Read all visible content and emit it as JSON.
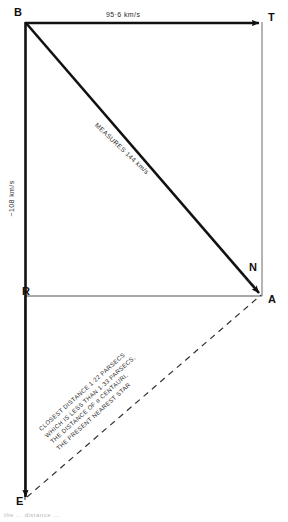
{
  "diagram": {
    "type": "vector-velocity-triangle",
    "background_color": "#ffffff",
    "stroke_color": "#111111",
    "vertices": [
      {
        "id": "B",
        "label": "B",
        "x": 25,
        "y": 22,
        "role": "top-left-origin"
      },
      {
        "id": "T",
        "label": "T",
        "x": 262,
        "y": 22,
        "role": "top-right-arrow-head"
      },
      {
        "id": "R",
        "label": "R",
        "x": 25,
        "y": 296,
        "role": "left-arrow-head"
      },
      {
        "id": "A",
        "label": "A",
        "x": 262,
        "y": 296,
        "role": "bottom-right-arrow-head"
      },
      {
        "id": "N",
        "label": "N",
        "x": 252,
        "y": 268,
        "role": "angle-marker"
      },
      {
        "id": "E",
        "label": "E",
        "x": 25,
        "y": 500,
        "role": "bottom-left-arrow-head"
      }
    ],
    "edges": [
      {
        "id": "BT",
        "from": "B",
        "to": "T",
        "style": "solid",
        "arrow": "end",
        "label": "95·6 km/s"
      },
      {
        "id": "BE",
        "from": "B",
        "to": "E",
        "style": "solid",
        "arrow": "end",
        "label": "~108 km/s"
      },
      {
        "id": "BA",
        "from": "B",
        "to": "A",
        "style": "solid",
        "arrow": "end",
        "label": "MEASURES 144 km/s"
      },
      {
        "id": "RA",
        "from": "R",
        "to": "A",
        "style": "thin-solid",
        "arrow": "none",
        "label": ""
      },
      {
        "id": "TA",
        "from": "T",
        "to": "A",
        "style": "thin-solid",
        "arrow": "none",
        "label": ""
      },
      {
        "id": "EA",
        "from": "E",
        "to": "A",
        "style": "dashed",
        "arrow": "none",
        "label": ""
      }
    ],
    "labels": {
      "top_edge": "95·6 km/s",
      "left_edge": "~108 km/s",
      "diagonal": "MEASURES 144 km/s",
      "vertex_b": "B",
      "vertex_t": "T",
      "vertex_r": "R",
      "vertex_a": "A",
      "vertex_n": "N",
      "vertex_e": "E"
    },
    "annotation": {
      "line1": "CLOSEST DISTANCE 1·22 PARSECS",
      "line2": "WHICH IS LESS THAN 1·33 PARSECS,",
      "line3": "THE DISTANCE OF α CENTAURI,",
      "line4": "THE PRESENT NEAREST STAR"
    },
    "caption": "the ... distance ..."
  }
}
